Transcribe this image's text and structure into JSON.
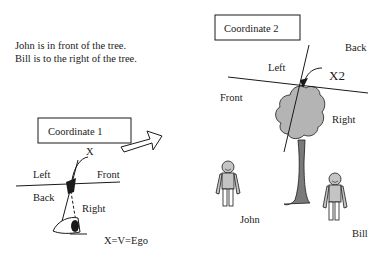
{
  "statements": [
    "John is in front of the tree.",
    "Bill is to the right of the tree."
  ],
  "coordinate1": {
    "title": "Coordinate 1",
    "labels": {
      "left": "Left",
      "front": "Front",
      "back": "Back",
      "right": "Right",
      "x": "X",
      "equation": "X=V=Ego"
    }
  },
  "coordinate2": {
    "title": "Coordinate 2",
    "labels": {
      "back": "Back",
      "left": "Left",
      "x2": "X2",
      "front": "Front",
      "right": "Right"
    }
  },
  "people": {
    "john": "John",
    "bill": "Bill"
  },
  "colors": {
    "ink": "#1a1a1a",
    "foliage": "#b4b4b4",
    "trunk": "#7a7a7a",
    "figure": "#c4c4c4"
  }
}
